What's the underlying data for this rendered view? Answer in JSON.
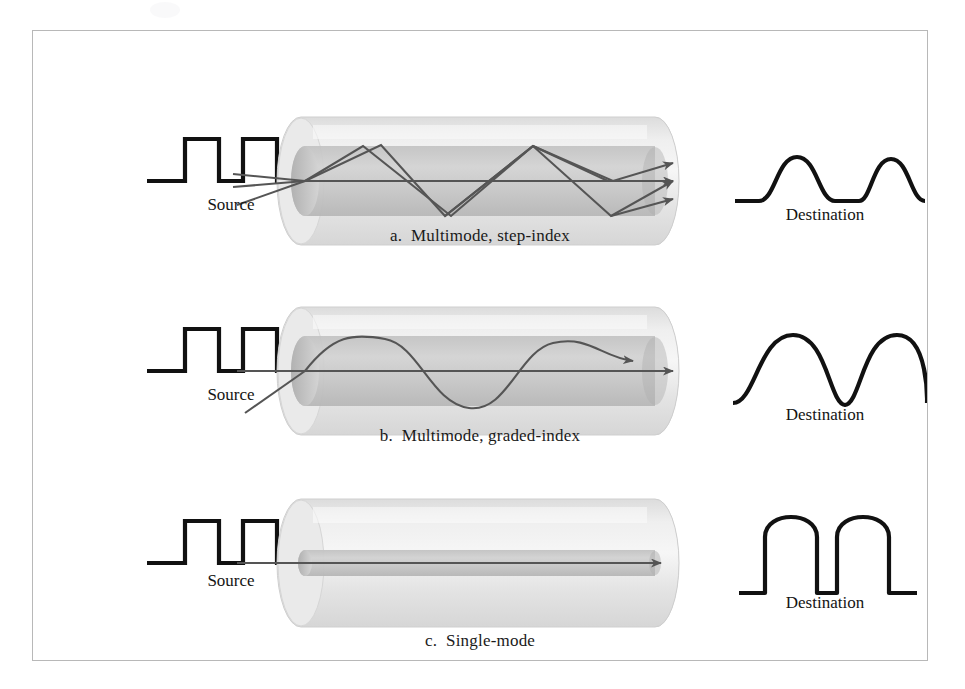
{
  "figure": {
    "border_color": "#b8b8b8",
    "background": "#ffffff"
  },
  "colors": {
    "cladding": "#e6e6e6",
    "cladding_edge": "#d2d2d2",
    "core": "#c9c9c9",
    "core_dark": "#b4b4b4",
    "end_cap": "#bdbdbd",
    "end_cap_dark": "#a8a8a8",
    "ray": "#555555",
    "waveform": "#111111"
  },
  "panels": [
    {
      "id": "a",
      "caption": "a.  Multimode, step-index",
      "source_label": "Source",
      "destination_label": "Destination",
      "source_waveform": "square-pulses",
      "destination_waveform": "rounded-spread-pulses",
      "mode": "multimode-step-index",
      "ray_count": 3,
      "ray_description": "zigzag total internal reflection plus axial ray"
    },
    {
      "id": "b",
      "caption": "b.  Multimode, graded-index",
      "source_label": "Source",
      "destination_label": "Destination",
      "source_waveform": "square-pulses",
      "destination_waveform": "gaussian-pulses",
      "mode": "multimode-graded-index",
      "ray_count": 2,
      "ray_description": "sinusoidal refracted ray plus axial ray"
    },
    {
      "id": "c",
      "caption": "c.  Single-mode",
      "source_label": "Source",
      "destination_label": "Destination",
      "source_waveform": "square-pulses",
      "destination_waveform": "near-square-pulses",
      "mode": "single-mode",
      "ray_count": 1,
      "ray_description": "single straight axial ray in narrow core"
    }
  ]
}
